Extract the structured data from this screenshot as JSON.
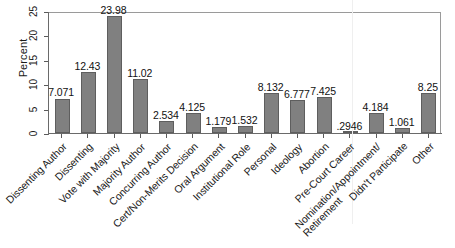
{
  "chart_data": {
    "type": "bar",
    "title": "",
    "xlabel": "",
    "ylabel": "Percent",
    "ylim": [
      0,
      25
    ],
    "yticks": [
      "0",
      "5",
      "10",
      "15",
      "20",
      "25"
    ],
    "grid": false,
    "legend": null,
    "bar_color": "#808080",
    "bar_edge_color": "#5e5e5e",
    "categories": [
      "Dissenting Author",
      "Dissenting",
      "Vote with Majority",
      "Majority Author",
      "Concurring Author",
      "Cert/Non-Merits Decision",
      "Oral Argument",
      "Institutional Role",
      "Personal",
      "Ideology",
      "Abortion",
      "Pre-Court Career",
      "Nomination/Appointment/\nRetirement",
      "Didn't Participate",
      "Other"
    ],
    "values": [
      7.071,
      12.43,
      23.98,
      11.02,
      2.534,
      4.125,
      1.179,
      1.532,
      8.132,
      6.777,
      7.425,
      0.2946,
      4.184,
      1.061,
      8.25
    ],
    "value_labels": [
      "7.071",
      "12.43",
      "23.98",
      "11.02",
      "2.534",
      "4.125",
      "1.179",
      "1.532",
      "8.132",
      "6.777",
      "7.425",
      ".2946",
      "4.184",
      "1.061",
      "8.25"
    ]
  }
}
